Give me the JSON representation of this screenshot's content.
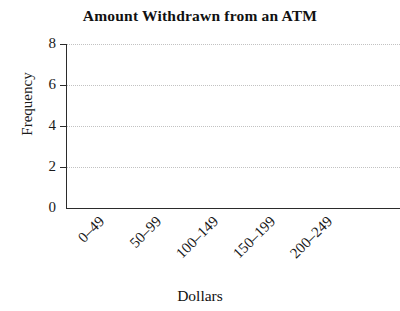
{
  "chart_data": {
    "type": "bar",
    "title": "Amount Withdrawn from an ATM",
    "xlabel": "Dollars",
    "ylabel": "Frequency",
    "categories": [
      "0–49",
      "50–99",
      "100–149",
      "150–199",
      "200–249"
    ],
    "values": [
      null,
      null,
      null,
      null,
      null
    ],
    "ytick_labels": [
      "0",
      "2",
      "4",
      "6",
      "8"
    ],
    "yticks": [
      0,
      2,
      4,
      6,
      8
    ],
    "ylim": [
      0,
      8
    ],
    "grid": "horizontal-dotted",
    "legend": null,
    "note": "Empty plot frame: axes, ticks and dotted gridlines drawn, no bars plotted",
    "colors": {
      "axis": "#2b2b2b",
      "grid": "#c2c2c2",
      "text": "#1a1a1a",
      "background": "#ffffff"
    }
  }
}
